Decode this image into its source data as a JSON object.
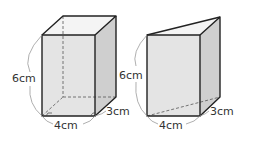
{
  "figures": [
    {
      "name": "rectangular-prism",
      "labels": {
        "height": "6cm",
        "width": "4cm",
        "depth": "3cm"
      }
    },
    {
      "name": "triangular-prism",
      "labels": {
        "height": "6cm",
        "width": "4cm",
        "depth": "3cm"
      }
    }
  ],
  "colors": {
    "edge": "#222222",
    "front_face": "#e6e6e6",
    "side_face": "#cfcfcf",
    "top_face": "#f4f4f4",
    "dim_arc": "#999999"
  }
}
